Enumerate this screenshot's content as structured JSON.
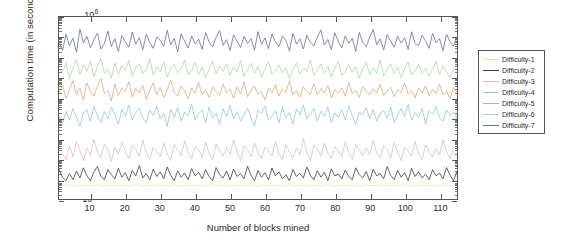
{
  "chart_data": {
    "type": "line",
    "title": "",
    "xlabel": "Number of blocks mined",
    "ylabel": "Computation time (in seconds)",
    "xlim": [
      1,
      115
    ],
    "ylim": [
      0.001,
      1000000
    ],
    "yscale": "log",
    "grid": false,
    "legend_position": "right-outside",
    "xticks": [
      10,
      20,
      30,
      40,
      50,
      60,
      70,
      80,
      90,
      100,
      110
    ],
    "ytick_labels": [
      "10-3",
      "10-2",
      "10-1",
      "100",
      "101",
      "102",
      "103",
      "104",
      "105",
      "106"
    ],
    "ytick_exponents": [
      -3,
      -2,
      -1,
      0,
      1,
      2,
      3,
      4,
      5,
      6
    ],
    "ytick_base": "10",
    "series": [
      {
        "name": "Difficulty-1",
        "color": "#e8e4b0",
        "values": [
          0.0045,
          0.0048,
          0.0046,
          0.005,
          0.0047,
          0.0044,
          0.0049,
          0.0046,
          0.0048,
          0.0045,
          0.0047,
          0.005,
          0.0046,
          0.0044,
          0.0048,
          0.0047,
          0.0045,
          0.0049,
          0.0046,
          0.0048,
          0.0044,
          0.0047,
          0.005,
          0.0046,
          0.0045,
          0.0048,
          0.0047,
          0.0044,
          0.0049,
          0.0046,
          0.0048,
          0.0045,
          0.0047,
          0.005,
          0.0046,
          0.0044,
          0.0048,
          0.0047,
          0.0045,
          0.0049,
          0.0046,
          0.0048,
          0.0044,
          0.0047,
          0.005,
          0.0046,
          0.0045,
          0.0048,
          0.0047,
          0.0044,
          0.0049,
          0.0046,
          0.0048,
          0.0045,
          0.0047,
          0.005,
          0.0046,
          0.0044,
          0.0048,
          0.0047,
          0.0045,
          0.0049,
          0.0046,
          0.0048,
          0.0044,
          0.0047,
          0.005,
          0.0046,
          0.0045,
          0.0048,
          0.0047,
          0.0044,
          0.0049,
          0.0046,
          0.0048,
          0.0045,
          0.0047,
          0.005,
          0.0046,
          0.0044,
          0.0048,
          0.0047,
          0.0045,
          0.0049,
          0.0046,
          0.0048,
          0.0044,
          0.0047,
          0.005,
          0.0046,
          0.0045,
          0.0048,
          0.0047,
          0.0044,
          0.0049,
          0.0046,
          0.0048,
          0.0045,
          0.0047,
          0.005,
          0.0046,
          0.0044,
          0.0048,
          0.0047,
          0.0045,
          0.0049,
          0.0046,
          0.0048,
          0.0044,
          0.0047,
          0.005,
          0.0046,
          0.0045,
          0.0048,
          0.0047
        ]
      },
      {
        "name": "Difficulty-2",
        "color": "#3f3f3f",
        "values": [
          0.03,
          0.012,
          0.008,
          0.018,
          0.009,
          0.024,
          0.011,
          0.035,
          0.014,
          0.008,
          0.022,
          0.04,
          0.013,
          0.009,
          0.028,
          0.016,
          0.01,
          0.033,
          0.012,
          0.02,
          0.008,
          0.026,
          0.014,
          0.045,
          0.011,
          0.018,
          0.009,
          0.03,
          0.013,
          0.022,
          0.01,
          0.038,
          0.015,
          0.008,
          0.025,
          0.012,
          0.019,
          0.009,
          0.032,
          0.014,
          0.021,
          0.01,
          0.028,
          0.013,
          0.008,
          0.036,
          0.016,
          0.011,
          0.024,
          0.009,
          0.03,
          0.013,
          0.018,
          0.01,
          0.042,
          0.015,
          0.008,
          0.026,
          0.012,
          0.02,
          0.009,
          0.034,
          0.014,
          0.022,
          0.01,
          0.016,
          0.008,
          0.029,
          0.013,
          0.019,
          0.011,
          0.038,
          0.015,
          0.009,
          0.025,
          0.012,
          0.021,
          0.008,
          0.031,
          0.014,
          0.017,
          0.01,
          0.027,
          0.013,
          0.009,
          0.035,
          0.016,
          0.011,
          0.023,
          0.008,
          0.03,
          0.014,
          0.018,
          0.01,
          0.04,
          0.015,
          0.009,
          0.026,
          0.012,
          0.02,
          0.008,
          0.033,
          0.013,
          0.022,
          0.011,
          0.017,
          0.009,
          0.028,
          0.014,
          0.019,
          0.01,
          0.036,
          0.015,
          0.008,
          0.024
        ]
      },
      {
        "name": "Difficulty-3",
        "color": "#e0b8cc",
        "values": [
          0.55,
          0.18,
          0.09,
          0.42,
          0.12,
          0.7,
          0.25,
          0.08,
          0.33,
          0.15,
          0.9,
          0.2,
          0.11,
          0.5,
          0.28,
          0.07,
          0.38,
          0.16,
          0.62,
          0.22,
          0.1,
          0.45,
          0.3,
          0.13,
          0.8,
          0.19,
          0.09,
          0.36,
          0.24,
          0.12,
          0.58,
          0.17,
          0.08,
          0.48,
          0.26,
          0.14,
          0.75,
          0.21,
          0.1,
          0.4,
          0.29,
          0.11,
          0.65,
          0.18,
          0.09,
          0.52,
          0.23,
          0.13,
          0.35,
          0.16,
          0.85,
          0.2,
          0.08,
          0.44,
          0.27,
          0.12,
          0.6,
          0.19,
          0.1,
          0.37,
          0.25,
          0.14,
          0.72,
          0.17,
          0.09,
          0.49,
          0.22,
          0.11,
          0.33,
          0.15,
          0.95,
          0.21,
          0.08,
          0.46,
          0.28,
          0.13,
          0.56,
          0.18,
          0.1,
          0.39,
          0.24,
          0.12,
          0.68,
          0.2,
          0.09,
          0.51,
          0.26,
          0.14,
          0.34,
          0.16,
          0.78,
          0.19,
          0.11,
          0.43,
          0.29,
          0.1,
          0.61,
          0.22,
          0.08,
          0.36,
          0.25,
          0.13,
          0.7,
          0.17,
          0.09,
          0.47,
          0.23,
          0.12,
          0.32,
          0.15,
          0.88,
          0.21,
          0.1,
          0.41,
          0.27
        ]
      },
      {
        "name": "Difficulty-4",
        "color": "#8fc9d4",
        "values": [
          14,
          5,
          22,
          8,
          30,
          11,
          4,
          18,
          26,
          7,
          40,
          13,
          6,
          21,
          9,
          35,
          15,
          5,
          28,
          12,
          45,
          8,
          19,
          31,
          10,
          6,
          24,
          14,
          38,
          9,
          17,
          4,
          27,
          11,
          33,
          7,
          20,
          13,
          48,
          8,
          16,
          25,
          6,
          36,
          10,
          18,
          5,
          29,
          12,
          42,
          9,
          21,
          7,
          15,
          32,
          11,
          4,
          26,
          17,
          39,
          8,
          13,
          23,
          6,
          34,
          10,
          19,
          5,
          28,
          14,
          44,
          9,
          16,
          30,
          7,
          22,
          12,
          37,
          6,
          18,
          11,
          25,
          8,
          41,
          13,
          5,
          20,
          15,
          33,
          9,
          27,
          7,
          17,
          24,
          10,
          36,
          6,
          14,
          29,
          12,
          46,
          8,
          19,
          11,
          31,
          5,
          23,
          16,
          38,
          10,
          7,
          26,
          13,
          20,
          9
        ]
      },
      {
        "name": "Difficulty-5",
        "color": "#e0a878",
        "values": [
          180,
          420,
          95,
          260,
          700,
          140,
          310,
          80,
          550,
          200,
          120,
          380,
          900,
          160,
          240,
          70,
          480,
          130,
          320,
          210,
          650,
          110,
          290,
          170,
          420,
          85,
          230,
          560,
          150,
          330,
          100,
          250,
          750,
          190,
          120,
          400,
          220,
          90,
          310,
          170,
          580,
          140,
          260,
          105,
          350,
          200,
          130,
          470,
          180,
          280,
          95,
          340,
          160,
          620,
          115,
          240,
          390,
          150,
          210,
          80,
          300,
          175,
          450,
          125,
          270,
          190,
          700,
          140,
          230,
          110,
          360,
          200,
          155,
          510,
          135,
          290,
          175,
          420,
          100,
          250,
          185,
          320,
          120,
          590,
          160,
          240,
          105,
          380,
          210,
          145,
          280,
          170,
          460,
          130,
          220,
          340,
          115,
          260,
          190,
          540,
          150,
          230,
          100,
          310,
          175,
          400,
          125,
          270,
          160,
          480,
          140,
          210,
          95,
          330,
          185
        ]
      },
      {
        "name": "Difficulty-6",
        "color": "#a8d9a8",
        "values": [
          2600,
          1800,
          5500,
          900,
          3200,
          7800,
          1400,
          4200,
          2100,
          6500,
          1100,
          3600,
          8800,
          1700,
          2800,
          950,
          5200,
          1500,
          3900,
          2300,
          7200,
          1200,
          3100,
          4800,
          1600,
          2500,
          8200,
          1300,
          3400,
          1900,
          6000,
          1050,
          2900,
          4400,
          1750,
          3000,
          7500,
          1350,
          2200,
          5800,
          1450,
          3300,
          980,
          2700,
          6800,
          1550,
          3800,
          2000,
          4600,
          1250,
          3500,
          1850,
          7000,
          1150,
          2400,
          5000,
          1650,
          3700,
          1050,
          2800,
          6200,
          1400,
          2100,
          4100,
          1750,
          3200,
          890,
          2600,
          5400,
          1500,
          3000,
          1950,
          7600,
          1300,
          2300,
          4700,
          1600,
          3600,
          1100,
          2900,
          6400,
          1250,
          2000,
          4300,
          1800,
          3400,
          950,
          2700,
          5600,
          1400,
          3100,
          1700,
          7900,
          1200,
          2500,
          4900,
          1550,
          3300,
          1000,
          2800,
          5900,
          1350,
          2200,
          4500,
          1650,
          3000,
          1120,
          2600,
          6600,
          1450,
          3800,
          1900,
          1050,
          2400,
          5100
        ]
      },
      {
        "name": "Difficulty-7",
        "color": "#6b6fa0",
        "values": [
          65000,
          22000,
          140000,
          38000,
          90000,
          18000,
          250000,
          52000,
          110000,
          30000,
          75000,
          160000,
          26000,
          48000,
          200000,
          35000,
          85000,
          20000,
          120000,
          60000,
          32000,
          180000,
          45000,
          95000,
          24000,
          140000,
          55000,
          28000,
          105000,
          70000,
          36000,
          220000,
          42000,
          88000,
          19000,
          150000,
          62000,
          29000,
          115000,
          47000,
          80000,
          25000,
          170000,
          58000,
          33000,
          98000,
          210000,
          40000,
          76000,
          22000,
          130000,
          66000,
          31000,
          108000,
          50000,
          86000,
          23000,
          190000,
          44000,
          92000,
          27000,
          145000,
          59000,
          34000,
          112000,
          68000,
          21000,
          155000,
          46000,
          82000,
          26000,
          125000,
          54000,
          37000,
          100000,
          230000,
          41000,
          78000,
          24000,
          165000,
          61000,
          30000,
          118000,
          49000,
          89000,
          20000,
          175000,
          57000,
          35000,
          102000,
          240000,
          43000,
          84000,
          23000,
          135000,
          64000,
          32000,
          110000,
          51000,
          94000,
          25000,
          185000,
          48000,
          39000,
          122000,
          67000,
          28000,
          158000,
          53000,
          87000,
          21000,
          142000,
          60000,
          36000,
          98000
        ]
      }
    ]
  },
  "legend": {
    "entries": [
      {
        "label": "Difficulty-1"
      },
      {
        "label": "Difficulty-2"
      },
      {
        "label": "Difficulty-3"
      },
      {
        "label": "Difficulty-4"
      },
      {
        "label": "Difficulty-5"
      },
      {
        "label": "Difficulty-6"
      },
      {
        "label": "Difficulty-7"
      }
    ]
  }
}
